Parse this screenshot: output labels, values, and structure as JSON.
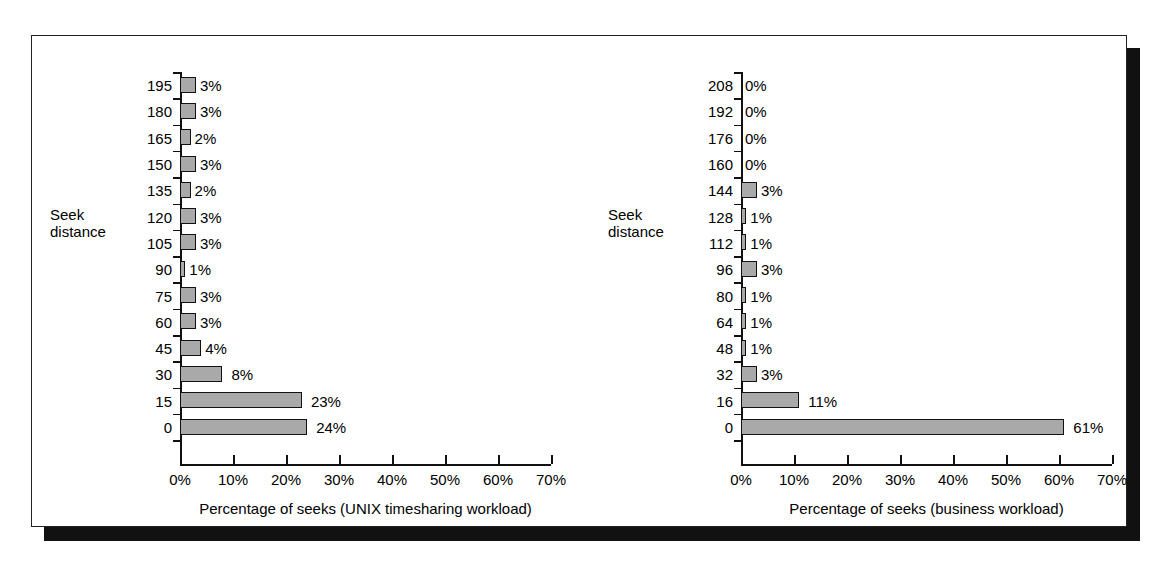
{
  "figure": {
    "colors": {
      "bar_fill": "#a9a9a9",
      "bar_stroke": "#111111",
      "frame": "#222222",
      "shadow": "#111111",
      "background": "#ffffff"
    }
  },
  "chart_data": [
    {
      "type": "bar",
      "orientation": "horizontal",
      "title": "",
      "xlabel": "Percentage of seeks (UNIX timesharing workload)",
      "ylabel": "Seek\ndistance",
      "ylabel_lines": [
        "Seek",
        "distance"
      ],
      "categories": [
        "0",
        "15",
        "30",
        "45",
        "60",
        "75",
        "90",
        "105",
        "120",
        "135",
        "150",
        "165",
        "180",
        "195"
      ],
      "values": [
        24,
        23,
        8,
        4,
        3,
        3,
        1,
        3,
        3,
        2,
        3,
        2,
        3,
        3
      ],
      "data_labels": [
        "24%",
        "23%",
        "8%",
        "4%",
        "3%",
        "3%",
        "1%",
        "3%",
        "3%",
        "2%",
        "3%",
        "2%",
        "3%",
        "3%"
      ],
      "xlim": [
        0,
        70
      ],
      "xticks": [
        0,
        10,
        20,
        30,
        40,
        50,
        60,
        70
      ],
      "xtick_labels": [
        "0%",
        "10%",
        "20%",
        "30%",
        "40%",
        "50%",
        "60%",
        "70%"
      ],
      "grid": false,
      "legend": false
    },
    {
      "type": "bar",
      "orientation": "horizontal",
      "title": "",
      "xlabel": "Percentage of seeks (business workload)",
      "ylabel": "Seek\ndistance",
      "ylabel_lines": [
        "Seek",
        "distance"
      ],
      "categories": [
        "0",
        "16",
        "32",
        "48",
        "64",
        "80",
        "96",
        "112",
        "128",
        "144",
        "160",
        "176",
        "192",
        "208"
      ],
      "values": [
        61,
        11,
        3,
        1,
        1,
        1,
        3,
        1,
        1,
        3,
        0,
        0,
        0,
        0
      ],
      "data_labels": [
        "61%",
        "11%",
        "3%",
        "1%",
        "1%",
        "1%",
        "3%",
        "1%",
        "1%",
        "3%",
        "0%",
        "0%",
        "0%",
        "0%"
      ],
      "xlim": [
        0,
        70
      ],
      "xticks": [
        0,
        10,
        20,
        30,
        40,
        50,
        60,
        70
      ],
      "xtick_labels": [
        "0%",
        "10%",
        "20%",
        "30%",
        "40%",
        "50%",
        "60%",
        "70%"
      ],
      "grid": false,
      "legend": false
    }
  ]
}
